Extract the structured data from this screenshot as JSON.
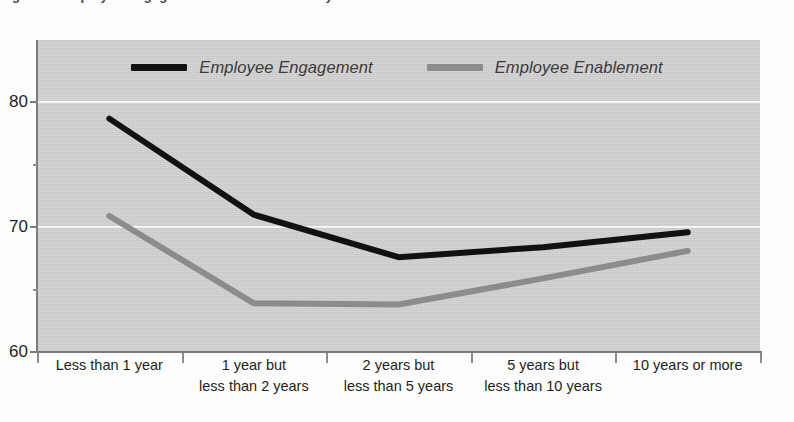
{
  "page": {
    "caption_remnant": "Figure 5.  Employee Engagement and Enablement by Tenure"
  },
  "chart_data": {
    "type": "line",
    "title": "",
    "xlabel": "",
    "ylabel": "",
    "categories": [
      "Less than 1 year",
      "1 year but less than 2 years",
      "2 years but less than 5 years",
      "5 years but less than 10 years",
      "10 years or more"
    ],
    "category_lines": [
      [
        "Less than 1 year",
        ""
      ],
      [
        "1 year but",
        "less than 2 years"
      ],
      [
        "2 years but",
        "less than 5 years"
      ],
      [
        "5 years but",
        "less than 10 years"
      ],
      [
        "10 years or more",
        ""
      ]
    ],
    "series": [
      {
        "name": "Employee Engagement",
        "color": "#111111",
        "values": [
          78.7,
          71.0,
          67.6,
          68.4,
          69.6
        ]
      },
      {
        "name": "Employee Enablement",
        "color": "#8c8c8c",
        "values": [
          70.9,
          63.9,
          63.8,
          65.9,
          68.1
        ]
      }
    ],
    "ylim": [
      60,
      85
    ],
    "yticks": [
      60,
      70,
      80
    ],
    "ytick_labels": [
      "60",
      "70",
      "80"
    ],
    "yminor": [
      65,
      75
    ],
    "grid": true,
    "grid_color": "#f4f4f4",
    "legend_position": "top-center",
    "plot_background": "#d3d3d3"
  }
}
